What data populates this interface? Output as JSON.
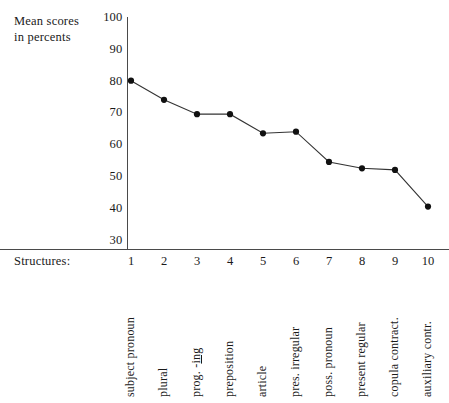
{
  "title_block": {
    "y_axis_title": "Mean scores\nin percents",
    "x_axis_title": "Structures:"
  },
  "chart_data": {
    "type": "line",
    "title": "",
    "subtitle": "",
    "xlabel": "Structures:",
    "ylabel": "Mean scores in percents",
    "ylim": [
      30,
      100
    ],
    "xlim": [
      1,
      10
    ],
    "grid": false,
    "legend": "none",
    "y_ticks": [
      100,
      90,
      80,
      70,
      60,
      50,
      40,
      30
    ],
    "x_ticks": [
      "1",
      "2",
      "3",
      "4",
      "5",
      "6",
      "7",
      "8",
      "9",
      "10"
    ],
    "categories": [
      "subject pronoun",
      "plural",
      "prog. -ing",
      "preposition",
      "article",
      "pres. irregular",
      "poss. pronoun",
      "present regular",
      "copula contract.",
      "auxiliary contr."
    ],
    "x": [
      1,
      2,
      3,
      4,
      5,
      6,
      7,
      8,
      9,
      10
    ],
    "values": [
      80,
      74,
      69.5,
      69.5,
      63.5,
      64,
      54.5,
      52.5,
      52,
      40.5
    ],
    "series": [
      {
        "name": "Mean scores in percents",
        "values": [
          80,
          74,
          69.5,
          69.5,
          63.5,
          64,
          54.5,
          52.5,
          52,
          40.5
        ],
        "marker": "filled-circle",
        "color": "#111111"
      }
    ]
  },
  "category_labels": [
    {
      "text": "subject pronoun",
      "underlined_suffix": ""
    },
    {
      "text": "plural",
      "underlined_suffix": ""
    },
    {
      "text": "prog. -",
      "underlined_suffix": "ing"
    },
    {
      "text": "preposition",
      "underlined_suffix": ""
    },
    {
      "text": "article",
      "underlined_suffix": ""
    },
    {
      "text": "pres. irregular",
      "underlined_suffix": ""
    },
    {
      "text": "poss. pronoun",
      "underlined_suffix": ""
    },
    {
      "text": "present regular",
      "underlined_suffix": ""
    },
    {
      "text": "copula contract.",
      "underlined_suffix": ""
    },
    {
      "text": "auxiliary contr.",
      "underlined_suffix": ""
    }
  ],
  "colors": {
    "line": "#333333",
    "marker": "#111111",
    "axis": "#4a4a4a",
    "text": "#1a1a1a",
    "background": "#ffffff"
  }
}
